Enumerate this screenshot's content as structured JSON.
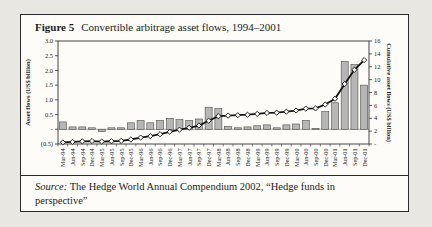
{
  "figure": {
    "label": "Figure 5",
    "title": "Convertible arbitrage asset flows, 1994–2001",
    "source_prefix": "Source:",
    "source_text": " The Hedge World Annual Compendium 2002, “Hedge funds in perspective”"
  },
  "chart_data": {
    "type": "bar",
    "title": "Convertible arbitrage asset flows, 1994–2001",
    "grid": false,
    "legend": "none",
    "categories": [
      "Mar-94",
      "Jun-94",
      "Sep-94",
      "Dec-94",
      "Mar-95",
      "Jun-95",
      "Sep-95",
      "Dec-95",
      "Mar-96",
      "Jun-96",
      "Sep-96",
      "Dec-96",
      "Mar-97",
      "Jun-97",
      "Sep-97",
      "Dec-97",
      "Mar-98",
      "Jun-98",
      "Sep-98",
      "Dec-98",
      "Mar-99",
      "Jun-99",
      "Sep-99",
      "Dec-99",
      "Mar-00",
      "Jun-00",
      "Sep-00",
      "Dec-00",
      "Mar-01",
      "Jun-01",
      "Sep-01",
      "Dec-01"
    ],
    "series": [
      {
        "name": "Quarterly asset flows",
        "type": "bar",
        "axis": "left",
        "values": [
          0.25,
          0.08,
          0.08,
          0.05,
          -0.08,
          0.05,
          0.05,
          0.22,
          0.3,
          0.22,
          0.3,
          0.37,
          0.33,
          0.3,
          0.35,
          0.75,
          0.7,
          0.1,
          0.05,
          0.08,
          0.12,
          0.15,
          0.05,
          0.15,
          0.18,
          0.3,
          0.03,
          0.6,
          0.9,
          2.3,
          2.2,
          1.5
        ]
      },
      {
        "name": "Cumulative asset flows",
        "type": "line",
        "axis": "right",
        "values": [
          0.25,
          0.33,
          0.41,
          0.46,
          0.38,
          0.43,
          0.48,
          0.7,
          1.0,
          1.22,
          1.52,
          1.89,
          2.22,
          2.52,
          2.87,
          3.62,
          4.32,
          4.42,
          4.47,
          4.55,
          4.67,
          4.82,
          4.87,
          5.02,
          5.2,
          5.5,
          5.53,
          6.13,
          7.03,
          9.33,
          11.53,
          13.03
        ]
      }
    ],
    "left_axis": {
      "label": "Asset flows (US$ billion)",
      "min": -0.5,
      "max": 3.0,
      "tick_labels": [
        "3.0",
        "2.5",
        "2.0",
        "1.5",
        "1.0",
        "0.5",
        "-",
        "(0.5)"
      ],
      "tick_values": [
        3.0,
        2.5,
        2.0,
        1.5,
        1.0,
        0.5,
        0,
        -0.5
      ]
    },
    "right_axis": {
      "label": "Cumulative asset flows (US$ billion)",
      "min": 0,
      "max": 16,
      "tick_labels": [
        "16",
        "14",
        "12",
        "10",
        "8",
        "6",
        "4",
        "2",
        "-"
      ],
      "tick_values": [
        16,
        14,
        12,
        10,
        8,
        6,
        4,
        2,
        0
      ]
    },
    "colors": {
      "bar_fill": "#b6b6b6",
      "bar_stroke": "#4d4d4d",
      "line": "#141414",
      "marker_fill": "#ffffff",
      "axis": "#333333"
    }
  }
}
